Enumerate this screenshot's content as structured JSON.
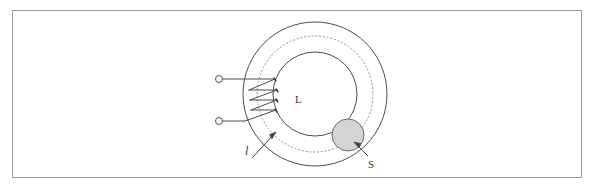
{
  "figure": {
    "type": "toroidal-core-diagram",
    "title": "",
    "frame": {
      "visible": true,
      "border_color": "#9a9a9a",
      "background_color": "#ffffff",
      "x": 12,
      "y": 10,
      "width": 570,
      "height": 168
    },
    "labels": {
      "coil": "L",
      "mean_path": "l",
      "sphere": "S"
    },
    "colors": {
      "line": "#4d4d4d",
      "dotted_line": "#8f8f8f",
      "sphere_fill": "#d4d4d4",
      "sphere_stroke": "#6b6b6b",
      "terminal_stroke": "#555555",
      "leader_line": "#444444"
    },
    "geometry": {
      "center_x": 315,
      "center_y": 94,
      "outer_radius": 72,
      "dotted_radius": 58,
      "inner_radius": 42,
      "sphere": {
        "cx": 348,
        "cy": 135,
        "r": 16
      },
      "terminals": [
        {
          "cx": 219,
          "cy": 79,
          "r": 3.5
        },
        {
          "cx": 219,
          "cy": 121,
          "r": 3.5
        }
      ],
      "winding_turns": 4
    },
    "elements": {
      "outer_circle_name": "toroid-outer-circle",
      "dotted_circle_name": "toroid-mean-path-circle",
      "inner_circle_name": "toroid-inner-circle",
      "sphere_name": "gap-sphere",
      "coil_name": "coil-winding",
      "lead_top_name": "lead-wire-top",
      "lead_bottom_name": "lead-wire-bottom"
    }
  }
}
